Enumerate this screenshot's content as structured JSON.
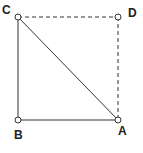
{
  "diagram": {
    "title": "",
    "points": [
      {
        "id": "A",
        "label": "A",
        "x": 118,
        "y": 120,
        "lx": 118,
        "ly": 135
      },
      {
        "id": "B",
        "label": "B",
        "x": 18,
        "y": 120,
        "lx": 14,
        "ly": 139
      },
      {
        "id": "C",
        "label": "C",
        "x": 18,
        "y": 17,
        "lx": 2,
        "ly": 14
      },
      {
        "id": "D",
        "label": "D",
        "x": 118,
        "y": 17,
        "lx": 128,
        "ly": 17
      }
    ],
    "segments": [
      {
        "from": "C",
        "to": "B",
        "style": "solid"
      },
      {
        "from": "B",
        "to": "A",
        "style": "solid"
      },
      {
        "from": "C",
        "to": "A",
        "style": "solid"
      },
      {
        "from": "C",
        "to": "D",
        "style": "dashed"
      },
      {
        "from": "D",
        "to": "A",
        "style": "dashed"
      }
    ],
    "colors": {
      "line": "#333333",
      "point_fill": "#ffffff",
      "label": "#222222"
    }
  }
}
